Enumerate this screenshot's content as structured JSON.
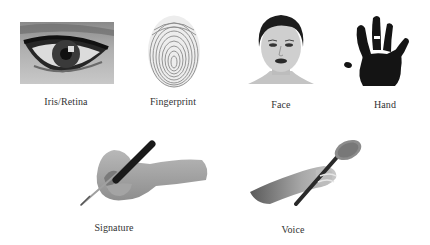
{
  "figure": {
    "items": [
      {
        "id": "iris",
        "label": "Iris/Retina",
        "icon": "eye-icon"
      },
      {
        "id": "fingerprint",
        "label": "Fingerprint",
        "icon": "fingerprint-icon"
      },
      {
        "id": "face",
        "label": "Face",
        "icon": "face-icon"
      },
      {
        "id": "hand",
        "label": "Hand",
        "icon": "handprint-icon"
      },
      {
        "id": "signature",
        "label": "Signature",
        "icon": "hand-writing-pen-icon"
      },
      {
        "id": "voice",
        "label": "Voice",
        "icon": "hand-holding-microphone-icon"
      }
    ]
  },
  "colors": {
    "background": "#ffffff",
    "label_text": "#333333",
    "ink": "#111111",
    "skin_gray": "#a8a8a8"
  }
}
